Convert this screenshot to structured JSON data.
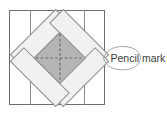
{
  "diagram": {
    "callout": {
      "label": "Pencil mark"
    },
    "icons": {
      "callout_shape": "teardrop-callout",
      "pencil_marks": "dashed-cross"
    },
    "theme": {
      "bg": "#ffffff",
      "square-stroke": "#6e6e6e",
      "fold-stroke": "#8a8a8a",
      "strip-fill": "#f1f1f1",
      "strip-stroke": "#8a8a8a",
      "diamond-fill": "#b5b5b5",
      "diamond-stroke": "#858585",
      "dash-stroke": "#676767",
      "callout-stroke": "#9c9c9c",
      "label-color": "#3b3b3b"
    }
  }
}
